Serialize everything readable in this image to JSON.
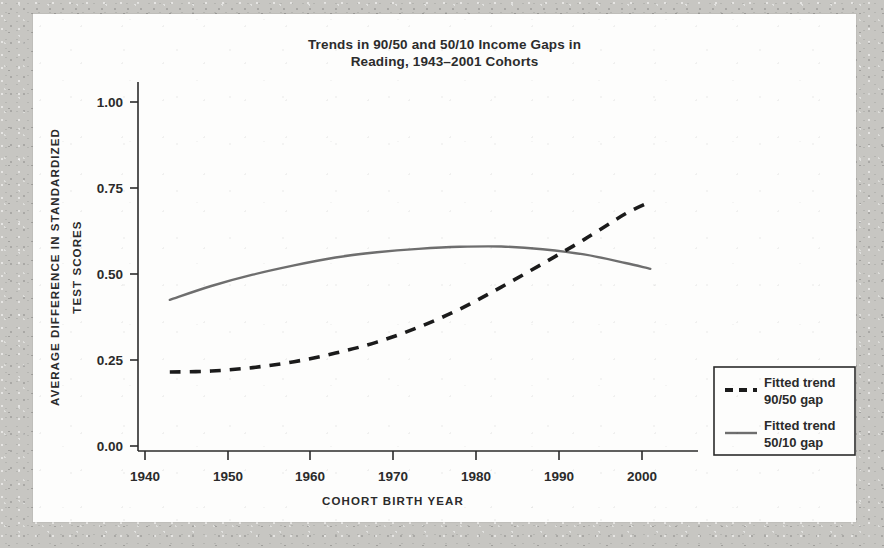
{
  "figure": {
    "title_line1": "Trends in 90/50 and 50/10 Income Gaps in",
    "title_line2": "Reading, 1943–2001 Cohorts"
  },
  "axes": {
    "ylabel_line1": "AVERAGE DIFFERENCE IN STANDARDIZED",
    "ylabel_line2": "TEST SCORES",
    "xlabel": "COHORT BIRTH YEAR",
    "yticks": [
      "0.00",
      "0.25",
      "0.50",
      "0.75",
      "1.00"
    ],
    "xticks": [
      "1940",
      "1950",
      "1960",
      "1970",
      "1980",
      "1990",
      "2000"
    ]
  },
  "legend": {
    "items": [
      {
        "line1": "Fitted trend",
        "line2": "90/50 gap",
        "style": "dashed",
        "color": "#1b1b1b"
      },
      {
        "line1": "Fitted trend",
        "line2": "50/10 gap",
        "style": "solid",
        "color": "#6e6e6e"
      }
    ]
  },
  "chart_data": {
    "type": "line",
    "title": "Trends in 90/50 and 50/10 Income Gaps in Reading, 1943–2001 Cohorts",
    "xlabel": "COHORT BIRTH YEAR",
    "ylabel": "AVERAGE DIFFERENCE IN STANDARDIZED TEST SCORES",
    "xlim": [
      1938,
      2007
    ],
    "ylim": [
      0.0,
      1.06
    ],
    "yticks": [
      0.0,
      0.25,
      0.5,
      0.75,
      1.0
    ],
    "xticks": [
      1940,
      1950,
      1960,
      1970,
      1980,
      1990,
      2000
    ],
    "grid": false,
    "legend_position": "right-lower-outside",
    "x": [
      1943,
      1948,
      1953,
      1958,
      1963,
      1968,
      1973,
      1978,
      1983,
      1988,
      1993,
      1998,
      2001
    ],
    "series": [
      {
        "name": "Fitted trend 90/50 gap",
        "style": "dashed",
        "color": "#1b1b1b",
        "values": [
          0.215,
          0.218,
          0.228,
          0.245,
          0.27,
          0.302,
          0.345,
          0.398,
          0.462,
          0.53,
          0.6,
          0.675,
          0.71
        ]
      },
      {
        "name": "Fitted trend 50/10 gap",
        "style": "solid",
        "color": "#6e6e6e",
        "values": [
          0.425,
          0.465,
          0.498,
          0.525,
          0.548,
          0.563,
          0.573,
          0.579,
          0.58,
          0.572,
          0.557,
          0.532,
          0.515
        ]
      }
    ],
    "annotations": [
      "Curves cross near cohort birth year 1992 at about 0.56"
    ]
  }
}
